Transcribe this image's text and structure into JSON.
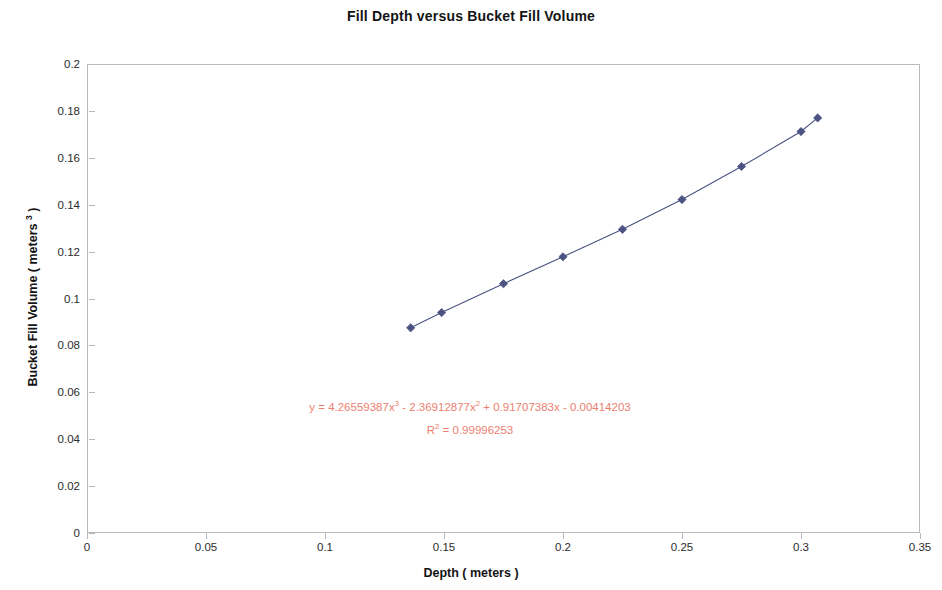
{
  "chart_data": {
    "type": "line",
    "title": "Fill Depth versus Bucket Fill Volume",
    "xlabel": "Depth ( meters )",
    "ylabel_parts": {
      "pre": "Bucket Fill Volume ( meters ",
      "sup": "3",
      "post": " )"
    },
    "xlim": [
      0,
      0.35
    ],
    "ylim": [
      0,
      0.2
    ],
    "xticks": [
      "0",
      "0.05",
      "0.1",
      "0.15",
      "0.2",
      "0.25",
      "0.3",
      "0.35"
    ],
    "xtick_values": [
      0,
      0.05,
      0.1,
      0.15,
      0.2,
      0.25,
      0.3,
      0.35
    ],
    "yticks": [
      "0",
      "0.02",
      "0.04",
      "0.06",
      "0.08",
      "0.1",
      "0.12",
      "0.14",
      "0.16",
      "0.18",
      "0.2"
    ],
    "ytick_values": [
      0,
      0.02,
      0.04,
      0.06,
      0.08,
      0.1,
      0.12,
      0.14,
      0.16,
      0.18,
      0.2
    ],
    "grid": false,
    "legend": false,
    "series": [
      {
        "name": "Bucket Fill Volume",
        "marker": "diamond",
        "color": "#4a5382",
        "x": [
          0.136,
          0.149,
          0.175,
          0.2,
          0.225,
          0.25,
          0.275,
          0.3,
          0.307
        ],
        "y": [
          0.0875,
          0.094,
          0.1063,
          0.1178,
          0.1295,
          0.1422,
          0.1563,
          0.1712,
          0.177
        ]
      }
    ],
    "annotations": {
      "equation": "y = 4.26559387x³ - 2.36912877x² + 0.91707383x - 0.00414203",
      "equation_parts": {
        "a": "y = 4.26559387x",
        "sup1": "3",
        "b": " - 2.36912877x",
        "sup2": "2",
        "c": " + 0.91707383x - 0.00414203"
      },
      "r_squared_parts": {
        "a": "R",
        "sup": "2",
        "b": " = 0.99996253"
      },
      "r_squared": "R² = 0.99996253",
      "color": "#ec8070"
    },
    "colors": {
      "series": "#4a5382",
      "axis": "#b9b9bd",
      "text": "#1a1a1a",
      "annotation": "#ec8070"
    }
  }
}
